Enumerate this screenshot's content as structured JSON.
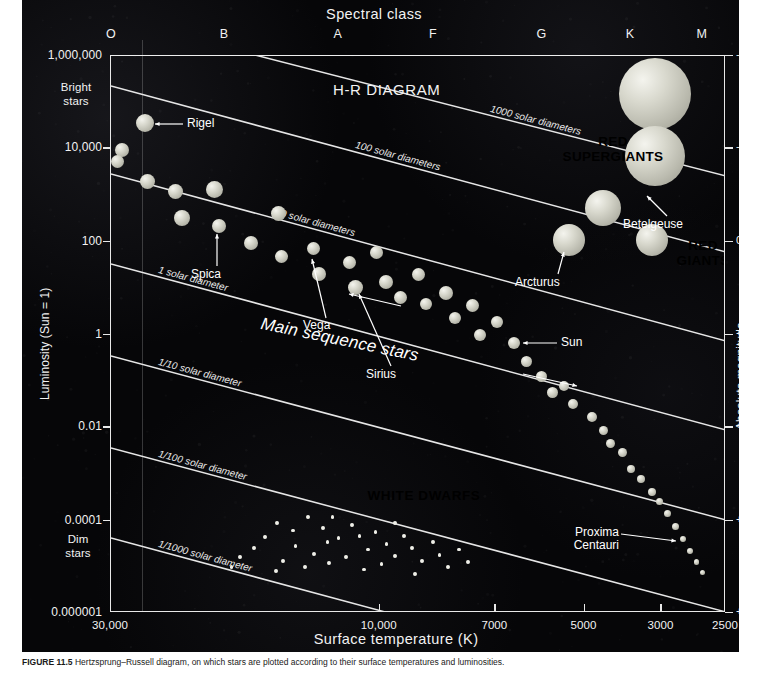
{
  "figure": {
    "title": "H-R DIAGRAM",
    "caption_label": "FIGURE 11.5",
    "caption_text": "Hertzsprung–Russell diagram, on which stars are plotted according to their surface temperatures and luminosities."
  },
  "axes": {
    "x_title": "Surface temperature (K)",
    "x_ticks": [
      "30,000",
      "10,000",
      "7000",
      "5000",
      "3000",
      "2500"
    ],
    "x_tick_frac": [
      0.0,
      0.437,
      0.625,
      0.77,
      0.895,
      1.0
    ],
    "y_title": "Luminosity (Sun = 1)",
    "y_ticks": [
      "1,000,000",
      "10,000",
      "100",
      "1",
      "0.01",
      "0.0001",
      "0.000001"
    ],
    "y_tick_frac": [
      0.0,
      0.1655,
      0.3335,
      0.5,
      0.6665,
      0.8345,
      1.0
    ],
    "y_top_note": "Bright\nstars",
    "y_bottom_note": "Dim\nstars",
    "y2_title": "Absolute magnitude",
    "y2_ticks": [
      "-10",
      "-5",
      "0",
      "+5",
      "+10",
      "+15",
      "+20"
    ],
    "y2_tick_frac": [
      0.0,
      0.1655,
      0.3335,
      0.5,
      0.6665,
      0.8345,
      1.0
    ],
    "spectral_title": "Spectral class",
    "spectral_classes": [
      "O",
      "B",
      "A",
      "F",
      "G",
      "K",
      "M"
    ],
    "spectral_frac": [
      0.0,
      0.185,
      0.37,
      0.525,
      0.7,
      0.845,
      0.96
    ]
  },
  "diameter_lines": [
    {
      "label": "1000 solar diameters"
    },
    {
      "label": "100 solar diameters"
    },
    {
      "label": "10 solar diameters"
    },
    {
      "label": "1 solar diameter"
    },
    {
      "label": "1/10 solar diameter"
    },
    {
      "label": "1/100 solar diameter"
    },
    {
      "label": "1/1000 solar diameter"
    }
  ],
  "regions": [
    {
      "name": "red-supergiants",
      "label": "RED\nSUPERGIANTS"
    },
    {
      "name": "red-giants",
      "label": "RED\nGIANTS"
    },
    {
      "name": "white-dwarfs",
      "label": "WHITE DWARFS"
    },
    {
      "name": "main-sequence",
      "label": "Main sequence stars"
    }
  ],
  "named_stars": [
    {
      "name": "Rigel",
      "label": "Rigel"
    },
    {
      "name": "Spica",
      "label": "Spica"
    },
    {
      "name": "Vega",
      "label": "Vega"
    },
    {
      "name": "Sirius",
      "label": "Sirius"
    },
    {
      "name": "Sun",
      "label": "Sun"
    },
    {
      "name": "Arcturus",
      "label": "Arcturus"
    },
    {
      "name": "Betelgeuse",
      "label": "Betelgeuse"
    },
    {
      "name": "ProximaCentauri",
      "label": "Proxima\nCentauri"
    }
  ],
  "colors": {
    "background": "#060608",
    "axis": "#e8e8e8",
    "text": "#f2f2f2",
    "star_fill": "#d2d2c6",
    "page": "#ffffff"
  },
  "chart_data": {
    "type": "scatter",
    "title": "H-R DIAGRAM",
    "xlabel": "Surface temperature (K)",
    "ylabel": "Luminosity (Sun = 1)",
    "y2label": "Absolute magnitude",
    "xlim": [
      30000,
      2500
    ],
    "ylim": [
      1e-06,
      1000000.0
    ],
    "x_scale": "log-reversed",
    "y_scale": "log",
    "grid": false,
    "legend": "none",
    "xticks": [
      30000,
      10000,
      7000,
      5000,
      3000,
      2500
    ],
    "yticks": [
      1e-06,
      0.0001,
      0.01,
      1,
      100,
      10000,
      1000000
    ],
    "y2ticks": [
      20,
      15,
      10,
      5,
      0,
      -5,
      -10
    ],
    "series": [
      {
        "name": "Main sequence",
        "points": [
          {
            "px": 0.018,
            "py": 0.168,
            "r": 7.0
          },
          {
            "px": 0.01,
            "py": 0.19,
            "r": 6.5
          },
          {
            "px": 0.055,
            "py": 0.12,
            "r": 9.0
          },
          {
            "px": 0.06,
            "py": 0.225,
            "r": 7.5
          },
          {
            "px": 0.105,
            "py": 0.243,
            "r": 7.5
          },
          {
            "px": 0.115,
            "py": 0.29,
            "r": 8.0
          },
          {
            "px": 0.168,
            "py": 0.24,
            "r": 8.5
          },
          {
            "px": 0.175,
            "py": 0.305,
            "r": 7.0
          },
          {
            "px": 0.228,
            "py": 0.335,
            "r": 7.0
          },
          {
            "px": 0.272,
            "py": 0.282,
            "r": 7.5
          },
          {
            "px": 0.278,
            "py": 0.36,
            "r": 6.5
          },
          {
            "px": 0.33,
            "py": 0.345,
            "r": 6.5
          },
          {
            "px": 0.338,
            "py": 0.392,
            "r": 7.0
          },
          {
            "px": 0.388,
            "py": 0.37,
            "r": 6.5
          },
          {
            "px": 0.398,
            "py": 0.415,
            "r": 7.5
          },
          {
            "px": 0.432,
            "py": 0.352,
            "r": 6.5
          },
          {
            "px": 0.447,
            "py": 0.405,
            "r": 7.0
          },
          {
            "px": 0.47,
            "py": 0.433,
            "r": 6.5
          },
          {
            "px": 0.5,
            "py": 0.392,
            "r": 6.5
          },
          {
            "px": 0.512,
            "py": 0.445,
            "r": 6.0
          },
          {
            "px": 0.545,
            "py": 0.425,
            "r": 7.0
          },
          {
            "px": 0.56,
            "py": 0.47,
            "r": 6.0
          },
          {
            "px": 0.588,
            "py": 0.448,
            "r": 6.5
          },
          {
            "px": 0.6,
            "py": 0.5,
            "r": 6.0
          },
          {
            "px": 0.628,
            "py": 0.478,
            "r": 6.0
          },
          {
            "px": 0.655,
            "py": 0.516,
            "r": 6.0
          },
          {
            "px": 0.676,
            "py": 0.548,
            "r": 5.5
          },
          {
            "px": 0.7,
            "py": 0.575,
            "r": 5.5
          },
          {
            "px": 0.718,
            "py": 0.605,
            "r": 5.5
          },
          {
            "px": 0.736,
            "py": 0.592,
            "r": 5.0
          },
          {
            "px": 0.752,
            "py": 0.625,
            "r": 5.0
          },
          {
            "px": 0.782,
            "py": 0.648,
            "r": 5.0
          },
          {
            "px": 0.8,
            "py": 0.672,
            "r": 4.5
          },
          {
            "px": 0.812,
            "py": 0.695,
            "r": 4.5
          },
          {
            "px": 0.832,
            "py": 0.712,
            "r": 4.5
          },
          {
            "px": 0.846,
            "py": 0.742,
            "r": 4.0
          },
          {
            "px": 0.862,
            "py": 0.76,
            "r": 4.0
          },
          {
            "px": 0.88,
            "py": 0.782,
            "r": 4.0
          },
          {
            "px": 0.892,
            "py": 0.8,
            "r": 3.5
          },
          {
            "px": 0.905,
            "py": 0.822,
            "r": 3.5
          },
          {
            "px": 0.918,
            "py": 0.845,
            "r": 3.5
          },
          {
            "px": 0.93,
            "py": 0.868,
            "r": 3.0
          },
          {
            "px": 0.942,
            "py": 0.888,
            "r": 3.0
          },
          {
            "px": 0.952,
            "py": 0.908,
            "r": 2.8
          },
          {
            "px": 0.962,
            "py": 0.928,
            "r": 2.6
          }
        ]
      },
      {
        "name": "White dwarfs",
        "points": [
          {
            "px": 0.27,
            "py": 0.838
          },
          {
            "px": 0.296,
            "py": 0.852
          },
          {
            "px": 0.32,
            "py": 0.828
          },
          {
            "px": 0.345,
            "py": 0.848
          },
          {
            "px": 0.352,
            "py": 0.872
          },
          {
            "px": 0.3,
            "py": 0.88
          },
          {
            "px": 0.33,
            "py": 0.894
          },
          {
            "px": 0.37,
            "py": 0.866
          },
          {
            "px": 0.392,
            "py": 0.842
          },
          {
            "px": 0.404,
            "py": 0.862
          },
          {
            "px": 0.418,
            "py": 0.886
          },
          {
            "px": 0.382,
            "py": 0.9
          },
          {
            "px": 0.355,
            "py": 0.91
          },
          {
            "px": 0.43,
            "py": 0.855
          },
          {
            "px": 0.448,
            "py": 0.876
          },
          {
            "px": 0.462,
            "py": 0.898
          },
          {
            "px": 0.44,
            "py": 0.912
          },
          {
            "px": 0.476,
            "py": 0.862
          },
          {
            "px": 0.49,
            "py": 0.884
          },
          {
            "px": 0.506,
            "py": 0.906
          },
          {
            "px": 0.524,
            "py": 0.872
          },
          {
            "px": 0.534,
            "py": 0.896
          },
          {
            "px": 0.548,
            "py": 0.918
          },
          {
            "px": 0.566,
            "py": 0.886
          },
          {
            "px": 0.58,
            "py": 0.908
          },
          {
            "px": 0.25,
            "py": 0.864
          },
          {
            "px": 0.232,
            "py": 0.884
          },
          {
            "px": 0.28,
            "py": 0.906
          },
          {
            "px": 0.316,
            "py": 0.918
          },
          {
            "px": 0.268,
            "py": 0.924
          },
          {
            "px": 0.412,
            "py": 0.922
          },
          {
            "px": 0.494,
            "py": 0.93
          },
          {
            "px": 0.36,
            "py": 0.828
          },
          {
            "px": 0.462,
            "py": 0.838
          },
          {
            "px": 0.21,
            "py": 0.9
          },
          {
            "px": 0.196,
            "py": 0.918
          }
        ]
      },
      {
        "name": "Red giants / supergiants",
        "points": [
          {
            "px": 0.885,
            "py": 0.068,
            "r": 36,
            "label": ""
          },
          {
            "px": 0.885,
            "py": 0.18,
            "r": 30,
            "label": "Betelgeuse"
          },
          {
            "px": 0.8,
            "py": 0.272,
            "r": 18,
            "label": ""
          },
          {
            "px": 0.745,
            "py": 0.33,
            "r": 16,
            "label": "Arcturus"
          },
          {
            "px": 0.88,
            "py": 0.33,
            "r": 16,
            "label": ""
          }
        ]
      }
    ],
    "annotations": [
      {
        "text": "Rigel",
        "px": 0.055,
        "py": 0.12
      },
      {
        "text": "Spica",
        "px": 0.175,
        "py": 0.305
      },
      {
        "text": "Vega",
        "px": 0.33,
        "py": 0.345
      },
      {
        "text": "Sirius",
        "px": 0.398,
        "py": 0.415
      },
      {
        "text": "Sun",
        "px": 0.655,
        "py": 0.516
      },
      {
        "text": "Arcturus",
        "px": 0.745,
        "py": 0.33
      },
      {
        "text": "Betelgeuse",
        "px": 0.885,
        "py": 0.18
      },
      {
        "text": "Proxima Centauri",
        "px": 0.93,
        "py": 0.868
      }
    ]
  }
}
